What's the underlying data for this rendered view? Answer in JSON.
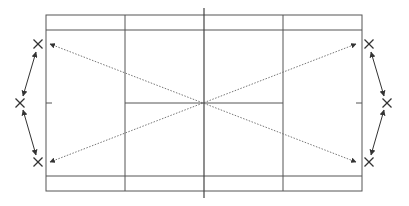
{
  "diagram": {
    "title": "",
    "type": "badminton-court-movement-diagram",
    "colors": {
      "background": "#ffffff",
      "court_lines": "#555555",
      "net_line": "#444444",
      "dotted_lines": "#666666",
      "arrows": "#333333",
      "markers": "#333333"
    },
    "court": {
      "outer": {
        "x1": 46,
        "y1": 15,
        "x2": 362,
        "y2": 191
      },
      "inner_top_y": 30,
      "inner_bottom_y": 176,
      "service_line_left_x": 125,
      "service_line_right_x": 283,
      "net": {
        "x": 204,
        "y1": 8,
        "y2": 198
      },
      "center_line": {
        "y": 103,
        "x1": 125,
        "x2": 283
      },
      "center_ticks": [
        {
          "x1": 46,
          "x2": 52,
          "y": 103
        },
        {
          "x1": 356,
          "x2": 362,
          "y": 103
        }
      ]
    },
    "markers": [
      {
        "id": "left-top",
        "x": 38,
        "y": 44,
        "glyph": "x-mark"
      },
      {
        "id": "left-mid",
        "x": 20,
        "y": 103,
        "glyph": "x-mark"
      },
      {
        "id": "left-bottom",
        "x": 38,
        "y": 162,
        "glyph": "x-mark"
      },
      {
        "id": "right-top",
        "x": 369,
        "y": 44,
        "glyph": "x-mark"
      },
      {
        "id": "right-mid",
        "x": 387,
        "y": 103,
        "glyph": "x-mark"
      },
      {
        "id": "right-bottom",
        "x": 369,
        "y": 162,
        "glyph": "x-mark"
      }
    ],
    "double_arrows": [
      {
        "id": "left-upper",
        "x1": 36,
        "y1": 52,
        "x2": 23,
        "y2": 96
      },
      {
        "id": "left-lower",
        "x1": 23,
        "y1": 110,
        "x2": 36,
        "y2": 155
      },
      {
        "id": "right-upper",
        "x1": 371,
        "y1": 52,
        "x2": 384,
        "y2": 96
      },
      {
        "id": "right-lower",
        "x1": 384,
        "y1": 110,
        "x2": 371,
        "y2": 155
      }
    ],
    "dotted_arrows": [
      {
        "id": "diag-tl-br",
        "x1": 50,
        "y1": 44,
        "x2": 356,
        "y2": 162
      },
      {
        "id": "diag-bl-tr",
        "x1": 50,
        "y1": 162,
        "x2": 356,
        "y2": 44
      }
    ]
  }
}
